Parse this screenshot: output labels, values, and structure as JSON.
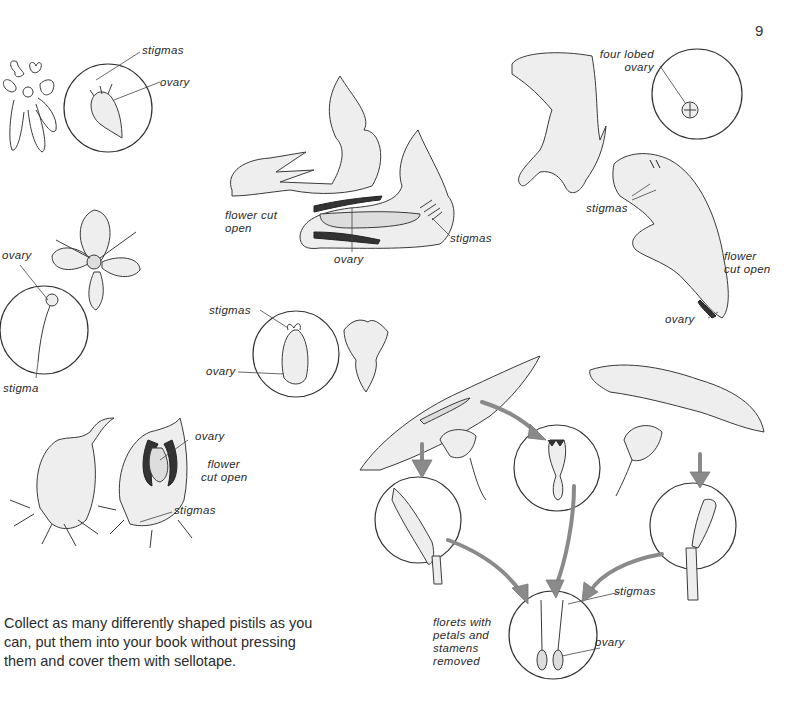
{
  "page": {
    "number": "9",
    "instructions": "Collect as many differently shaped pistils as you can, put them into your book without pressing them and cover them with sellotape."
  },
  "figures": {
    "fig1": {
      "stigmas": "stigmas",
      "ovary": "ovary"
    },
    "fig2": {
      "flower_cut_open_1": "flower cut",
      "flower_cut_open_2": "open",
      "ovary": "ovary",
      "stigmas": "stigmas"
    },
    "fig3": {
      "four_lobed_1": "four lobed",
      "four_lobed_2": "ovary",
      "stigmas": "stigmas",
      "flower_cut_open_1": "flower",
      "flower_cut_open_2": "cut open",
      "ovary": "ovary"
    },
    "fig4": {
      "ovary": "ovary",
      "stigma": "stigma"
    },
    "fig5": {
      "stigmas": "stigmas",
      "ovary": "ovary"
    },
    "fig6": {
      "ovary": "ovary",
      "flower_cut_open_1": "flower",
      "flower_cut_open_2": "cut open",
      "stigmas": "stigmas"
    },
    "fig7": {
      "stigmas": "stigmas",
      "ovary": "ovary",
      "florets_1": "florets with",
      "florets_2": "petals and",
      "florets_3": "stamens",
      "florets_4": "removed"
    }
  }
}
